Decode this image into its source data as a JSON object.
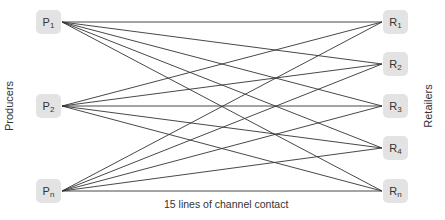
{
  "diagram": {
    "left_label": "Producers",
    "right_label": "Retailers",
    "caption": "15 lines of channel contact",
    "line_color": "#333333",
    "node_color": "#e3e3e3",
    "producers": [
      {
        "letter": "P",
        "sub": "1",
        "y": 22
      },
      {
        "letter": "P",
        "sub": "2",
        "y": 106
      },
      {
        "letter": "P",
        "sub": "n",
        "y": 191
      }
    ],
    "retailers": [
      {
        "letter": "R",
        "sub": "1",
        "y": 22
      },
      {
        "letter": "R",
        "sub": "2",
        "y": 64
      },
      {
        "letter": "R",
        "sub": "3",
        "y": 106
      },
      {
        "letter": "R",
        "sub": "4",
        "y": 148
      },
      {
        "letter": "R",
        "sub": "n",
        "y": 191
      }
    ]
  }
}
